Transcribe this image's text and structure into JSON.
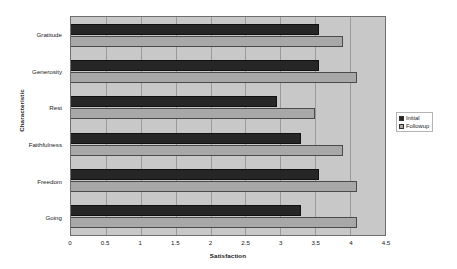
{
  "chart_data": {
    "type": "bar",
    "orientation": "horizontal",
    "title": "",
    "xlabel": "Satisfaction",
    "ylabel": "Characteristic",
    "categories": [
      "Gratitude",
      "Generosity",
      "Rest",
      "Faithfulness",
      "Freedom",
      "Going"
    ],
    "series": [
      {
        "name": "Initial",
        "color": "#262626",
        "values": [
          3.55,
          3.55,
          2.95,
          3.3,
          3.55,
          3.3
        ]
      },
      {
        "name": "Followup",
        "color": "#a8a8a8",
        "values": [
          3.9,
          4.1,
          3.5,
          3.9,
          4.1,
          4.1
        ]
      }
    ],
    "xlim": [
      0,
      4.5
    ],
    "xticks": [
      0,
      0.5,
      1,
      1.5,
      2,
      2.5,
      3,
      3.5,
      4,
      4.5
    ],
    "xtick_labels": [
      "0",
      "0.5",
      "1",
      "1.5",
      "2",
      "2.5",
      "3",
      "3.5",
      "4",
      "4.5"
    ],
    "grid": true,
    "grid_axis": "x",
    "legend_position": "right",
    "plot_background": "#c8c8c8",
    "figure_background": "#ffffff"
  }
}
